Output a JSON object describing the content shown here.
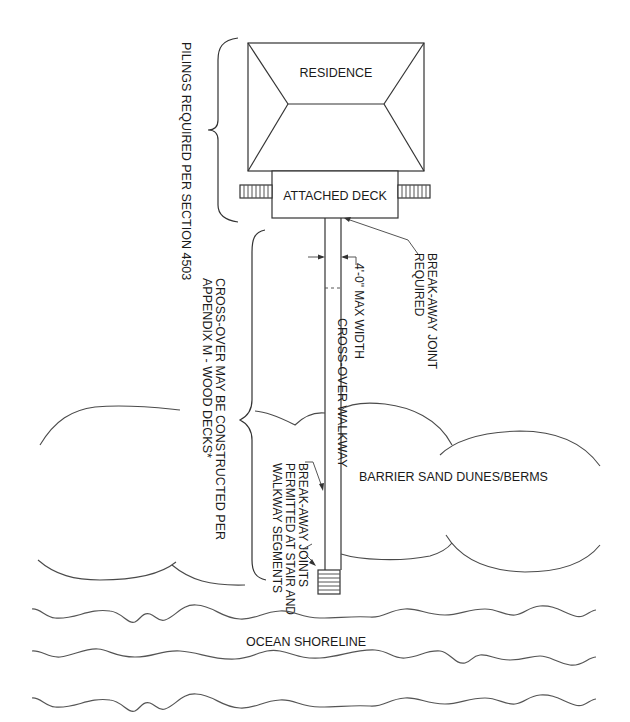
{
  "diagram": {
    "type": "site plan - dune cross-over walkway",
    "labels": {
      "residence": "RESIDENCE",
      "attached_deck": "ATTACHED DECK",
      "pilings_note": "PILINGS REQUIRED PER SECTION 4503",
      "crossover_note_line1": "CROSS-OVER MAY BE CONSTRUCTED PER",
      "crossover_note_line2": "APPENDIX M - WOOD DECKS*",
      "breakaway_joint_line1": "BREAK-AWAY JOINT",
      "breakaway_joint_line2": "REQUIRED",
      "max_width": "4'-0\" MAX WIDTH",
      "walkway": "CROSS-OVER WALKWAY",
      "breakaway_joints_line1": "BREAK-AWAY JOINTS",
      "breakaway_joints_line2": "PERMITTED AT STAIR AND",
      "breakaway_joints_line3": "WALKWAY SEGMENTS",
      "dunes": "BARRIER SAND DUNES/BERMS",
      "ocean": "OCEAN SHORELINE"
    },
    "colors": {
      "line": "#333333",
      "text": "#1a1a1a",
      "background": "#ffffff"
    }
  }
}
